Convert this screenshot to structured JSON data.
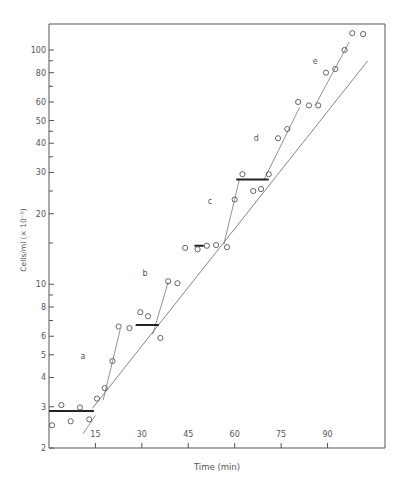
{
  "chart_data": {
    "type": "scatter",
    "title": "",
    "xlabel": "Time (min)",
    "ylabel": "Cells/ml (× 10⁻⁵)",
    "xlim": [
      0,
      108
    ],
    "ylim": [
      2,
      130
    ],
    "yscale": "log",
    "grid": false,
    "x_ticks": [
      15,
      30,
      45,
      60,
      75,
      90
    ],
    "y_ticks": [
      2,
      3,
      4,
      5,
      6,
      8,
      10,
      20,
      30,
      40,
      50,
      60,
      80,
      100
    ],
    "y_minor_ticks": [
      7,
      9,
      15,
      25,
      35,
      45,
      70,
      90
    ],
    "annotations": [
      {
        "text": "a",
        "x": 11,
        "y": 4.8
      },
      {
        "text": "b",
        "x": 31,
        "y": 10.8
      },
      {
        "text": "c",
        "x": 52,
        "y": 22
      },
      {
        "text": "d",
        "x": 67,
        "y": 41
      },
      {
        "text": "e",
        "x": 86,
        "y": 87
      }
    ],
    "series": [
      {
        "name": "observations",
        "points": [
          [
            1,
            2.5
          ],
          [
            4,
            3.05
          ],
          [
            7,
            2.6
          ],
          [
            10,
            2.98
          ],
          [
            13,
            2.65
          ],
          [
            15.5,
            3.25
          ],
          [
            18,
            3.6
          ],
          [
            20.5,
            4.7
          ],
          [
            22.5,
            6.6
          ],
          [
            26,
            6.5
          ],
          [
            29.5,
            7.6
          ],
          [
            32,
            7.3
          ],
          [
            36,
            5.9
          ],
          [
            38.5,
            10.3
          ],
          [
            41.5,
            10.1
          ],
          [
            44,
            14.3
          ],
          [
            48,
            14.1
          ],
          [
            51,
            14.6
          ],
          [
            54,
            14.7
          ],
          [
            57.5,
            14.4
          ],
          [
            60,
            23
          ],
          [
            62.5,
            29.5
          ],
          [
            66,
            25
          ],
          [
            68.5,
            25.5
          ],
          [
            71,
            29.5
          ],
          [
            74,
            42
          ],
          [
            77,
            46
          ],
          [
            80.5,
            60
          ],
          [
            84,
            58
          ],
          [
            87,
            58
          ],
          [
            89.5,
            80
          ],
          [
            92.5,
            83
          ],
          [
            95.5,
            100
          ],
          [
            98,
            118
          ],
          [
            101.5,
            117
          ]
        ]
      },
      {
        "name": "exponential_fit",
        "line": [
          [
            14,
            2.95
          ],
          [
            103,
            90
          ]
        ]
      },
      {
        "name": "step_segments",
        "segments": [
          [
            [
              11,
              2.3
            ],
            [
              15,
              2.75
            ]
          ],
          [
            [
              17.5,
              3.2
            ],
            [
              23,
              6.4
            ]
          ],
          [
            [
              33.5,
              6.1
            ],
            [
              38.5,
              10.2
            ]
          ],
          [
            [
              56.5,
              14.8
            ],
            [
              61.5,
              28
            ]
          ],
          [
            [
              69.5,
              28
            ],
            [
              81,
              57
            ]
          ],
          [
            [
              86,
              58
            ],
            [
              97,
              108
            ]
          ]
        ]
      },
      {
        "name": "plateaus",
        "segments": [
          [
            [
              0,
              2.88
            ],
            [
              14.5,
              2.88
            ]
          ],
          [
            [
              28,
              6.7
            ],
            [
              35.5,
              6.7
            ]
          ],
          [
            [
              47,
              14.6
            ],
            [
              50,
              14.6
            ]
          ],
          [
            [
              60.5,
              28
            ],
            [
              71,
              28
            ]
          ]
        ]
      }
    ]
  },
  "axes": {
    "x_label": "Time (min)",
    "y_label": "Cells/ml (× 10⁻⁵)"
  }
}
